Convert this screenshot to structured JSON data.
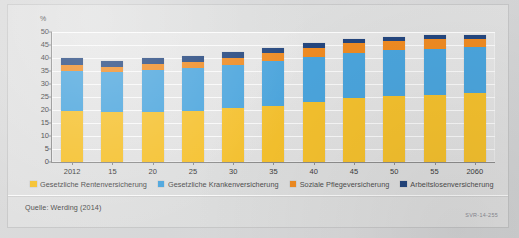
{
  "figure": {
    "axis_unit": "%",
    "source": "Quelle: Werding (2014)",
    "code": "SVR-14-255"
  },
  "legend": {
    "position": "bottom",
    "items": [
      {
        "label": "Gesetzliche Rentenversicherung",
        "color": "#f5c12e",
        "icon": "legend-swatch"
      },
      {
        "label": "Gesetzliche Krankenversicherung",
        "color": "#4ba5dd",
        "icon": "legend-swatch"
      },
      {
        "label": "Soziale Pflegeversicherung",
        "color": "#ef8b22",
        "icon": "legend-swatch"
      },
      {
        "label": "Arbeitslosenversicherung",
        "color": "#24467e",
        "icon": "legend-swatch"
      }
    ]
  },
  "chart_data": {
    "type": "bar",
    "stacked": true,
    "title": "",
    "subtitle": "",
    "xlabel": "",
    "ylabel": "%",
    "ylim": [
      0,
      50
    ],
    "yticks": [
      0,
      5,
      10,
      15,
      20,
      25,
      30,
      35,
      40,
      45,
      50
    ],
    "grid": true,
    "legend_position": "bottom",
    "categories": [
      "2012",
      "15",
      "20",
      "25",
      "30",
      "35",
      "40",
      "45",
      "50",
      "55",
      "2060"
    ],
    "series": [
      {
        "name": "Gesetzliche Rentenversicherung",
        "color": "#f5c12e",
        "values": [
          19.6,
          19.1,
          19.4,
          19.8,
          20.7,
          21.6,
          23.0,
          24.8,
          25.5,
          25.9,
          26.4
        ]
      },
      {
        "name": "Gesetzliche Krankenversicherung",
        "color": "#4ba5dd",
        "values": [
          15.5,
          15.4,
          16.0,
          16.3,
          16.8,
          17.2,
          17.4,
          17.3,
          17.4,
          17.6,
          17.8
        ]
      },
      {
        "name": "Soziale Pflegeversicherung",
        "color": "#ef8b22",
        "values": [
          2.1,
          1.9,
          2.2,
          2.3,
          2.6,
          3.0,
          3.3,
          3.5,
          3.7,
          3.8,
          3.2
        ]
      },
      {
        "name": "Arbeitslosenversicherung",
        "color": "#24467e",
        "values": [
          2.9,
          2.3,
          2.3,
          2.2,
          2.3,
          2.2,
          1.9,
          1.6,
          1.5,
          1.4,
          1.3
        ]
      }
    ],
    "totals": [
      40.1,
      38.7,
      39.9,
      40.6,
      42.4,
      44.0,
      45.6,
      47.2,
      48.1,
      48.7,
      48.7
    ]
  }
}
